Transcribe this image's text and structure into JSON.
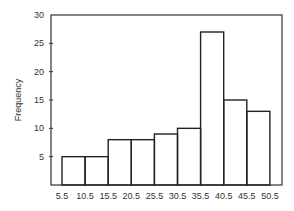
{
  "chart_data": {
    "type": "bar",
    "title": "",
    "xlabel": "",
    "ylabel": "Frequency",
    "bin_edges": [
      5.5,
      10.5,
      15.5,
      20.5,
      25.5,
      30.5,
      35.5,
      40.5,
      45.5,
      50.5
    ],
    "categories": [
      "5.5-10.5",
      "10.5-15.5",
      "15.5-20.5",
      "20.5-25.5",
      "25.5-30.5",
      "30.5-35.5",
      "35.5-40.5",
      "40.5-45.5",
      "45.5-50.5"
    ],
    "values": [
      5,
      5,
      8,
      8,
      9,
      10,
      27,
      15,
      13
    ],
    "ylim": [
      0,
      30
    ],
    "yticks": [
      5,
      10,
      15,
      20,
      25,
      30
    ],
    "xtick_labels": [
      "5.5",
      "10.5",
      "15.5",
      "20.5",
      "25.5",
      "30.5",
      "35.5",
      "40.5",
      "45.5",
      "50.5"
    ],
    "grid": false,
    "legend": null
  }
}
